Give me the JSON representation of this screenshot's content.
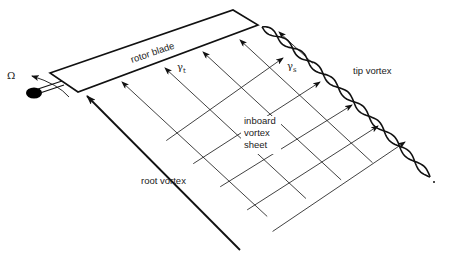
{
  "figure": {
    "labels": {
      "omega": "Ω",
      "rotor_blade": "rotor blade",
      "gamma_t": "γ",
      "gamma_t_sub": "t",
      "gamma_s": "γ",
      "gamma_s_sub": "s",
      "tip_vortex": "tip vortex",
      "inboard_line1": "inboard",
      "inboard_line2": "vortex",
      "inboard_line3": "sheet",
      "root_vortex": "root vortex"
    },
    "colors": {
      "ink": "#111111",
      "background": "#ffffff",
      "hub": "#000000"
    },
    "trailed_vortex_lines": 6,
    "shed_vortex_lines": 6
  }
}
